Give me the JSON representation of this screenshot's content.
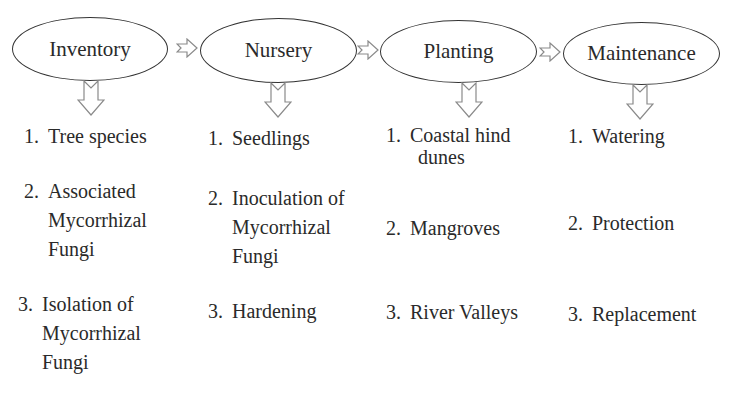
{
  "diagram": {
    "type": "process-flow",
    "stages": [
      {
        "label": "Inventory",
        "items": [
          {
            "number": "1.",
            "lines": [
              "Tree species"
            ]
          },
          {
            "number": "2.",
            "lines": [
              "Associated",
              "Mycorrhizal",
              "Fungi"
            ]
          },
          {
            "number": "3.",
            "lines": [
              "Isolation of",
              "Mycorrhizal",
              "Fungi"
            ]
          }
        ]
      },
      {
        "label": "Nursery",
        "items": [
          {
            "number": "1.",
            "lines": [
              "Seedlings"
            ]
          },
          {
            "number": "2.",
            "lines": [
              "Inoculation of",
              "Mycorrhizal",
              "Fungi"
            ]
          },
          {
            "number": "3.",
            "lines": [
              "Hardening"
            ]
          }
        ]
      },
      {
        "label": "Planting",
        "items": [
          {
            "number": "1.",
            "lines": [
              "Coastal hind",
              "dunes"
            ]
          },
          {
            "number": "2.",
            "lines": [
              "Mangroves"
            ]
          },
          {
            "number": "3.",
            "lines": [
              "River Valleys"
            ]
          }
        ]
      },
      {
        "label": "Maintenance",
        "items": [
          {
            "number": "1.",
            "lines": [
              "Watering"
            ]
          },
          {
            "number": "2.",
            "lines": [
              "Protection"
            ]
          },
          {
            "number": "3.",
            "lines": [
              "Replacement"
            ]
          }
        ]
      }
    ],
    "connectors": {
      "between_stages": "right-arrow-icon",
      "stage_to_items": "down-arrow-icon"
    },
    "colors": {
      "ellipse_stroke": "#333333",
      "arrow_stroke": "#8a8a8a",
      "text": "#2a2a2a",
      "background": "#ffffff"
    }
  }
}
